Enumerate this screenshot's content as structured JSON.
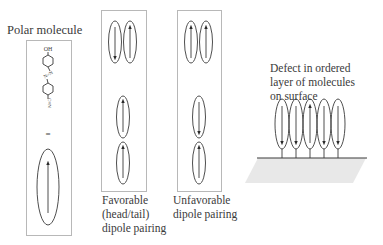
{
  "panels": {
    "polar": {
      "title": "Polar molecule",
      "structure_labels": {
        "top": "OH",
        "azo": "N=N",
        "bottom": "C≡N"
      },
      "equals_sign": "=",
      "dipoles": [
        "up"
      ]
    },
    "favorable": {
      "caption_lines": [
        "Favorable",
        "(head/tail)",
        "dipole pairing"
      ],
      "side_by_side": [
        "down",
        "up"
      ],
      "stacked": [
        "up",
        "up"
      ]
    },
    "unfavorable": {
      "caption_lines": [
        "Unfavorable",
        "dipole pairing"
      ],
      "side_by_side": [
        "up",
        "up"
      ],
      "stacked": [
        "down",
        "up"
      ]
    },
    "surface": {
      "caption_lines": [
        "Defect in ordered",
        "layer of molecules",
        "on surface"
      ],
      "molecules": [
        "down",
        "down",
        "up",
        "down",
        "down"
      ]
    }
  },
  "colors": {
    "line": "#3a3a3a",
    "box": "#b8b8b8",
    "surface": "#e6e6e6"
  }
}
